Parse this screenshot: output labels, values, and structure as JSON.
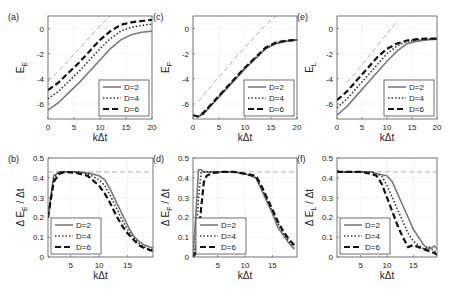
{
  "figure": {
    "legend_entries": [
      "D=2",
      "D=4",
      "D=6"
    ]
  },
  "chart_data": [
    {
      "panel": "(a)",
      "type": "line",
      "title": "",
      "xlabel": "kΔt",
      "ylabel": "E_E",
      "xlim": [
        0,
        20
      ],
      "ylim": [
        -7.2,
        1
      ],
      "xticks": [
        0,
        5,
        10,
        15,
        20
      ],
      "yticks": [
        -6,
        -4,
        -2,
        0
      ],
      "grid": true,
      "legend_position": "lower right",
      "x": [
        0,
        2,
        4,
        6,
        8,
        10,
        12,
        14,
        16,
        18,
        20
      ],
      "series": [
        {
          "name": "D=2",
          "style": "solid",
          "values": [
            -6.5,
            -5.9,
            -5.1,
            -4.3,
            -3.4,
            -2.5,
            -1.6,
            -0.9,
            -0.5,
            -0.3,
            -0.2
          ]
        },
        {
          "name": "D=4",
          "style": "dotted",
          "values": [
            -5.6,
            -5.0,
            -4.2,
            -3.4,
            -2.5,
            -1.6,
            -0.8,
            -0.2,
            0.1,
            0.25,
            0.35
          ]
        },
        {
          "name": "D=6",
          "style": "dashed",
          "values": [
            -4.9,
            -4.3,
            -3.5,
            -2.7,
            -1.8,
            -0.9,
            -0.2,
            0.3,
            0.5,
            0.6,
            0.7
          ]
        },
        {
          "name": "reference",
          "style": "thin-dashed-gray",
          "values": [
            -4.2,
            -3.4,
            -2.5,
            -1.6,
            -0.7,
            0.2,
            1.0,
            null,
            null,
            null,
            null
          ]
        }
      ]
    },
    {
      "panel": "(b)",
      "type": "line",
      "xlabel": "kΔt",
      "ylabel": "Δ E_E / Δt",
      "xlim": [
        1,
        19.5
      ],
      "ylim": [
        0,
        0.5
      ],
      "xticks": [
        5,
        10,
        15
      ],
      "yticks": [
        0,
        0.1,
        0.2,
        0.3,
        0.4,
        0.5
      ],
      "grid": true,
      "legend_position": "lower left",
      "x": [
        1,
        2,
        3,
        4,
        6,
        8,
        10,
        11,
        12,
        13,
        14,
        15,
        16,
        17,
        18,
        19,
        19.5
      ],
      "series": [
        {
          "name": "D=2",
          "style": "solid",
          "values": [
            0.2,
            0.41,
            0.43,
            0.43,
            0.43,
            0.425,
            0.41,
            0.39,
            0.34,
            0.28,
            0.22,
            0.16,
            0.11,
            0.08,
            0.06,
            0.05,
            0.045
          ]
        },
        {
          "name": "D=4",
          "style": "dotted",
          "values": [
            0.2,
            0.4,
            0.43,
            0.43,
            0.43,
            0.42,
            0.39,
            0.36,
            0.31,
            0.25,
            0.19,
            0.14,
            0.1,
            0.07,
            0.05,
            0.04,
            0.035
          ]
        },
        {
          "name": "D=6",
          "style": "dashed",
          "values": [
            0.2,
            0.38,
            0.42,
            0.43,
            0.425,
            0.41,
            0.36,
            0.32,
            0.27,
            0.21,
            0.16,
            0.12,
            0.09,
            0.06,
            0.045,
            0.035,
            0.03
          ]
        },
        {
          "name": "reference",
          "style": "thin-dashed-gray",
          "values": [
            0.43,
            0.43,
            0.43,
            0.43,
            0.43,
            0.43,
            0.43,
            0.43,
            0.43,
            0.43,
            0.43,
            0.43,
            0.43,
            0.43,
            0.43,
            0.43,
            0.43
          ]
        }
      ]
    },
    {
      "panel": "(c)",
      "type": "line",
      "xlabel": "kΔt",
      "ylabel": "E_F",
      "xlim": [
        0,
        20
      ],
      "ylim": [
        -7.2,
        1
      ],
      "xticks": [
        0,
        5,
        10,
        15,
        20
      ],
      "yticks": [
        -6,
        -4,
        -2,
        0
      ],
      "grid": true,
      "legend_position": "lower right",
      "x": [
        0,
        1,
        2,
        4,
        6,
        8,
        10,
        12,
        14,
        16,
        18,
        20
      ],
      "series": [
        {
          "name": "D=2",
          "style": "solid",
          "values": [
            -6.9,
            -7.0,
            -6.8,
            -5.9,
            -5.0,
            -4.1,
            -3.2,
            -2.4,
            -1.6,
            -1.2,
            -1.0,
            -0.9
          ]
        },
        {
          "name": "D=4",
          "style": "dotted",
          "values": [
            -6.9,
            -7.0,
            -6.8,
            -5.85,
            -4.95,
            -4.05,
            -3.15,
            -2.35,
            -1.55,
            -1.15,
            -1.0,
            -0.9
          ]
        },
        {
          "name": "D=6",
          "style": "dashed",
          "values": [
            -6.9,
            -7.0,
            -6.7,
            -5.8,
            -4.9,
            -4.0,
            -3.1,
            -2.3,
            -1.5,
            -1.1,
            -0.95,
            -0.9
          ]
        },
        {
          "name": "reference",
          "style": "thin-dashed-gray",
          "values": [
            null,
            -5.8,
            -5.3,
            -4.3,
            -3.4,
            -2.4,
            -1.5,
            -0.6,
            0.3,
            1.0,
            null,
            null
          ]
        }
      ]
    },
    {
      "panel": "(d)",
      "type": "line",
      "xlabel": "kΔt",
      "ylabel": "Δ E_F / Δt",
      "xlim": [
        0.5,
        19.5
      ],
      "ylim": [
        0,
        0.5
      ],
      "xticks": [
        5,
        10,
        15
      ],
      "yticks": [
        0,
        0.1,
        0.2,
        0.3,
        0.4,
        0.5
      ],
      "grid": true,
      "legend_position": "lower left",
      "x": [
        0.5,
        1,
        1.5,
        2,
        2.5,
        3,
        4,
        6,
        8,
        10,
        12,
        13,
        14,
        15,
        16,
        17,
        18,
        19
      ],
      "series": [
        {
          "name": "D=2",
          "style": "solid",
          "values": [
            0,
            0.2,
            0.44,
            0.44,
            0.43,
            0.43,
            0.43,
            0.43,
            0.43,
            0.42,
            0.4,
            0.34,
            0.28,
            0.22,
            0.15,
            0.11,
            0.07,
            0.04
          ]
        },
        {
          "name": "D=4",
          "style": "dotted",
          "values": [
            0,
            0.05,
            0.3,
            0.43,
            0.43,
            0.43,
            0.43,
            0.43,
            0.43,
            0.42,
            0.4,
            0.35,
            0.29,
            0.23,
            0.17,
            0.12,
            0.08,
            0.05
          ]
        },
        {
          "name": "D=6",
          "style": "dashed",
          "values": [
            0,
            0.02,
            0.1,
            0.25,
            0.38,
            0.41,
            0.425,
            0.43,
            0.43,
            0.42,
            0.41,
            0.36,
            0.3,
            0.24,
            0.18,
            0.13,
            0.09,
            0.06
          ]
        },
        {
          "name": "reference",
          "style": "thin-dashed-gray",
          "values": [
            0.43,
            0.43,
            0.43,
            0.43,
            0.43,
            0.43,
            0.43,
            0.43,
            0.43,
            0.43,
            0.43,
            0.43,
            0.43,
            0.43,
            0.43,
            0.43,
            0.43,
            0.43
          ]
        }
      ]
    },
    {
      "panel": "(e)",
      "type": "line",
      "xlabel": "kΔt",
      "ylabel": "E_L",
      "xlim": [
        0,
        20
      ],
      "ylim": [
        -7.2,
        1
      ],
      "xticks": [
        0,
        5,
        10,
        15,
        20
      ],
      "yticks": [
        -6,
        -4,
        -2,
        0
      ],
      "grid": true,
      "legend_position": "lower right",
      "x": [
        0,
        2,
        4,
        6,
        8,
        10,
        12,
        14,
        16,
        18,
        20
      ],
      "series": [
        {
          "name": "D=2",
          "style": "solid",
          "values": [
            -6.9,
            -6.2,
            -5.3,
            -4.4,
            -3.5,
            -2.6,
            -1.8,
            -1.2,
            -1.0,
            -0.9,
            -0.85
          ]
        },
        {
          "name": "D=4",
          "style": "dotted",
          "values": [
            -6.3,
            -5.6,
            -4.7,
            -3.8,
            -2.9,
            -2.0,
            -1.4,
            -1.0,
            -0.9,
            -0.85,
            -0.8
          ]
        },
        {
          "name": "D=6",
          "style": "dashed",
          "values": [
            -5.7,
            -5.0,
            -4.1,
            -3.2,
            -2.3,
            -1.6,
            -1.2,
            -0.95,
            -0.85,
            -0.8,
            -0.8
          ]
        },
        {
          "name": "reference",
          "style": "thin-dashed-gray",
          "values": [
            null,
            -4.3,
            -3.4,
            -2.4,
            -1.4,
            -0.4,
            0.6,
            null,
            null,
            null,
            null
          ]
        }
      ]
    },
    {
      "panel": "(f)",
      "type": "line",
      "xlabel": "kΔt",
      "ylabel": "Δ E_L / Δt",
      "xlim": [
        0.5,
        19.5
      ],
      "ylim": [
        0,
        0.5
      ],
      "xticks": [
        5,
        10,
        15
      ],
      "yticks": [
        0,
        0.1,
        0.2,
        0.3,
        0.4,
        0.5
      ],
      "grid": true,
      "legend_position": "lower left",
      "x": [
        0.5,
        1,
        3,
        5,
        7,
        8,
        9,
        10,
        11,
        12,
        13,
        14,
        15,
        16,
        17,
        18,
        19,
        19.5
      ],
      "series": [
        {
          "name": "D=2",
          "style": "solid",
          "values": [
            0.44,
            0.43,
            0.43,
            0.43,
            0.43,
            0.42,
            0.415,
            0.41,
            0.38,
            0.32,
            0.26,
            0.2,
            0.14,
            0.1,
            0.06,
            0.04,
            0.055,
            0.04
          ]
        },
        {
          "name": "D=4",
          "style": "dotted",
          "values": [
            0.43,
            0.43,
            0.43,
            0.43,
            0.43,
            0.42,
            0.41,
            0.36,
            0.3,
            0.24,
            0.18,
            0.12,
            0.08,
            0.06,
            0.04,
            0.05,
            0.03,
            0.02
          ]
        },
        {
          "name": "D=6",
          "style": "dashed",
          "values": [
            0.43,
            0.43,
            0.43,
            0.43,
            0.42,
            0.41,
            0.37,
            0.3,
            0.23,
            0.16,
            0.1,
            0.05,
            0.06,
            0.05,
            0.04,
            0.03,
            0.02,
            0.01
          ]
        },
        {
          "name": "reference",
          "style": "thin-dashed-gray",
          "values": [
            0.43,
            0.43,
            0.43,
            0.43,
            0.43,
            0.43,
            0.43,
            0.43,
            0.43,
            0.43,
            0.43,
            0.43,
            0.43,
            0.43,
            0.43,
            0.43,
            0.43,
            0.43
          ]
        }
      ]
    }
  ]
}
